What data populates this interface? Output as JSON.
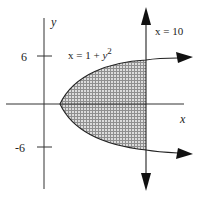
{
  "diagram": {
    "type": "region-plot",
    "curve_label": {
      "prefix": "x = 1 + ",
      "var": "y",
      "exp": "2"
    },
    "line_label": "x = 10",
    "x_axis_label": "x",
    "y_axis_label": "y",
    "y_ticks": [
      {
        "value": 6,
        "label": "6"
      },
      {
        "value": -6,
        "label": "-6"
      }
    ],
    "region": "bounded by x = 1 + y^2 and x = 10, shaded with grid pattern",
    "colors": {
      "stroke": "#222222",
      "shade": "#9a9a9a",
      "grid": "#e8e8e8",
      "background": "#ffffff"
    }
  }
}
